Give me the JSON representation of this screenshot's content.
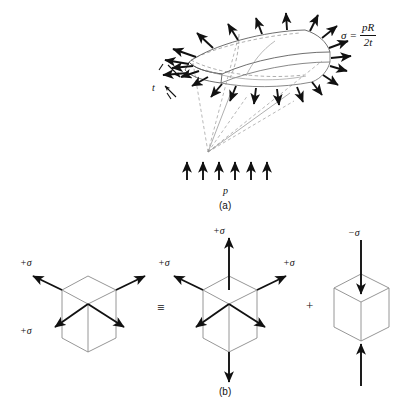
{
  "figure": {
    "background_color": "#ffffff",
    "line_color": "#111111",
    "cube_edge_color": "#8a8a8a",
    "dashed_color": "#9a9a9a"
  },
  "part_a": {
    "caption": "(a)",
    "pressure_label": "p",
    "thickness_label": "t",
    "formula": {
      "lhs": "σ",
      "equals": "=",
      "numerator": "pR",
      "denominator": "2t"
    },
    "pressure_arrow_count": 6,
    "stress_arrow_count": 22
  },
  "part_b": {
    "caption": "(b)",
    "equivalence_symbol": "≡",
    "plus_symbol": "+",
    "cubes": [
      {
        "name": "biaxial-cube",
        "labels": [
          {
            "text": "+σ",
            "position": "upper-left"
          },
          {
            "text": "+σ",
            "position": "lower-left"
          }
        ],
        "arrow_directions": [
          "upper-left",
          "upper-right",
          "lower-left",
          "lower-right"
        ],
        "arrow_sense": "outward"
      },
      {
        "name": "triaxial-cube",
        "labels": [
          {
            "text": "+σ",
            "position": "top"
          },
          {
            "text": "+σ",
            "position": "upper-left"
          },
          {
            "text": "+σ",
            "position": "upper-right"
          }
        ],
        "arrow_directions": [
          "up",
          "down",
          "upper-left",
          "upper-right",
          "lower-left",
          "lower-right"
        ],
        "arrow_sense": "outward"
      },
      {
        "name": "compression-cube",
        "labels": [
          {
            "text": "−σ",
            "position": "top"
          }
        ],
        "arrow_directions": [
          "down-into-top",
          "up-into-bottom"
        ],
        "arrow_sense": "inward"
      }
    ]
  }
}
